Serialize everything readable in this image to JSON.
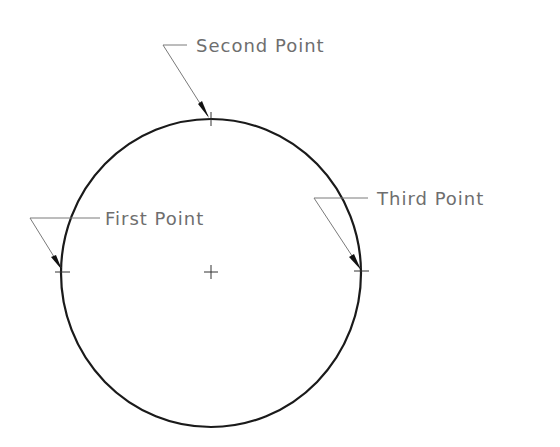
{
  "diagram": {
    "type": "three-point circle construction",
    "circle": {
      "cx": 211,
      "cy": 272,
      "rx": 150,
      "ry": 154,
      "stroke": "#1a1a1a"
    },
    "center_mark": "+",
    "labels": [
      {
        "id": "second",
        "text": "Second Point",
        "point": [
          211,
          118
        ],
        "text_x": 196,
        "text_y": 52
      },
      {
        "id": "first",
        "text": "First Point",
        "point": [
          62,
          270
        ],
        "text_x": 103,
        "text_y": 224
      },
      {
        "id": "third",
        "text": "Third Point",
        "point": [
          361,
          270
        ],
        "text_x": 374,
        "text_y": 203
      }
    ],
    "label_color": "#6e6e6e"
  }
}
